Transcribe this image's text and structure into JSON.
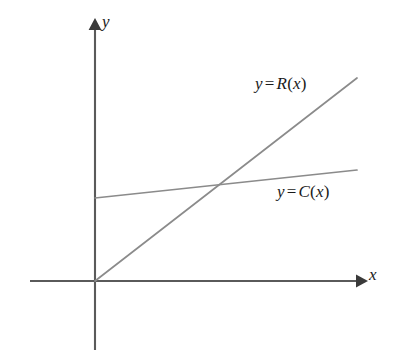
{
  "figure": {
    "background_color": "#ffffff",
    "axis_color": "#5a5a5a",
    "curve_color": "#8b8b8b",
    "text_color": "#1a1a1a",
    "axes": {
      "x_axis_label": "x",
      "y_axis_label": "y",
      "x_axis_name": "x-axis",
      "y_axis_name": "y-axis",
      "origin": {
        "x": 95,
        "y": 281
      },
      "x_axis_start": {
        "x": 30,
        "y": 281
      },
      "x_axis_end": {
        "x": 362,
        "y": 281
      },
      "y_axis_top": {
        "x": 95,
        "y": 22
      },
      "y_axis_bottom": {
        "x": 95,
        "y": 350
      },
      "arrowheads": [
        "x-axis-arrow",
        "y-axis-arrow"
      ],
      "ticks": [],
      "tick_labels": [],
      "grid": false
    },
    "labels": {
      "revenue": {
        "text": "y = R(x)",
        "y_var": "y",
        "equals": "=",
        "fn_name": "R",
        "open_paren": "(",
        "arg": "x",
        "close_paren": ")"
      },
      "cost": {
        "text": "y = C(x)",
        "y_var": "y",
        "equals": "=",
        "fn_name": "C",
        "open_paren": "(",
        "arg": "x",
        "close_paren": ")"
      }
    }
  },
  "chart_data": {
    "type": "line",
    "title": "",
    "subtitle": "",
    "xlabel": "x",
    "ylabel": "y",
    "xlim": [
      0,
      3.4
    ],
    "ylim": [
      0,
      2.65
    ],
    "grid": false,
    "legend": "inline-labels",
    "legend_position": "right-of-lines",
    "axis_ticks_shown": false,
    "annotations": [
      {
        "name": "revenue-line-label",
        "text": "y = R(x)",
        "pixel": {
          "x": 255,
          "y": 74
        }
      },
      {
        "name": "cost-line-label",
        "text": "y = C(x)",
        "pixel": {
          "x": 277,
          "y": 182
        }
      }
    ],
    "series": [
      {
        "name": "y = R(x)",
        "label": "Revenue",
        "color": "#8b8b8b",
        "linear": true,
        "intercept": 0,
        "slope": 0.775,
        "x": [
          0,
          2.68
        ],
        "y": [
          0,
          2.08
        ],
        "pixel_start": {
          "x": 95,
          "y": 281
        },
        "pixel_end": {
          "x": 357,
          "y": 78
        }
      },
      {
        "name": "y = C(x)",
        "label": "Cost",
        "color": "#8b8b8b",
        "linear": true,
        "intercept": 0.85,
        "slope": 0.107,
        "x": [
          0,
          2.68
        ],
        "y": [
          0.85,
          1.14
        ],
        "pixel_start": {
          "x": 95,
          "y": 198
        },
        "pixel_end": {
          "x": 357,
          "y": 170
        }
      }
    ],
    "intersection": {
      "name": "break-even-point",
      "x": 1.28,
      "y": 0.99,
      "pixel": {
        "x": 220,
        "y": 184
      },
      "marked": false
    }
  }
}
